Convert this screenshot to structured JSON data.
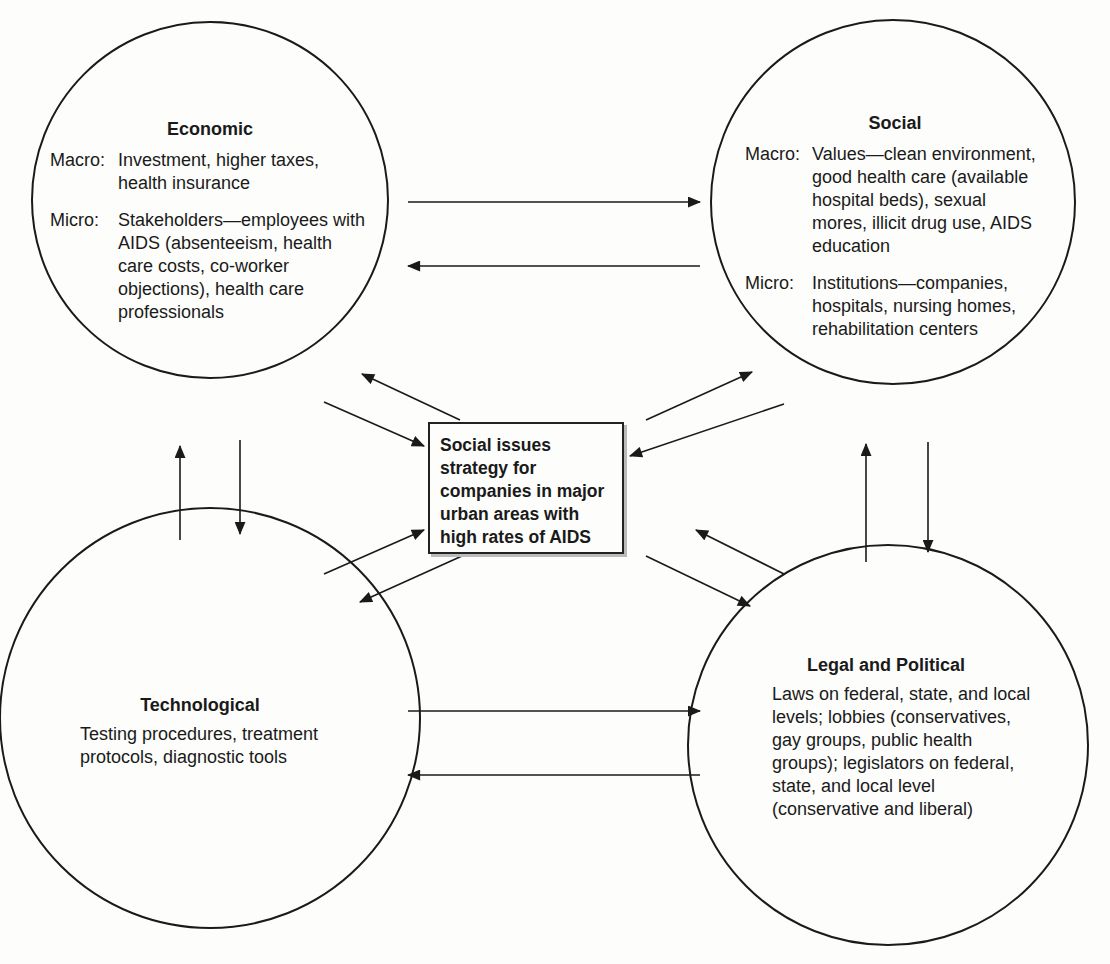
{
  "diagram": {
    "center": {
      "text": "Social issues strategy for companies in major urban areas with high rates of AIDS"
    },
    "nodes": {
      "economic": {
        "title": "Economic",
        "macro_label": "Macro:",
        "macro_text": "Investment, higher taxes, health insurance",
        "micro_label": "Micro:",
        "micro_text": "Stakeholders—employees with AIDS (absenteeism, health care costs, co-worker objections), health care professionals"
      },
      "social": {
        "title": "Social",
        "macro_label": "Macro:",
        "macro_text": "Values—clean environment, good health care (available hospital beds), sexual mores, illicit drug use, AIDS education",
        "micro_label": "Micro:",
        "micro_text": "Institutions—companies, hospitals, nursing homes, rehabilitation centers"
      },
      "technological": {
        "title": "Technological",
        "text": "Testing procedures, treatment protocols, diagnostic tools"
      },
      "legal_political": {
        "title": "Legal and Political",
        "text": "Laws on federal, state, and local levels; lobbies (conservatives, gay groups, public health groups); legislators on federal, state, and local level (conservative and liberal)"
      }
    },
    "connections": [
      {
        "from": "economic",
        "to": "social",
        "bidirectional": true
      },
      {
        "from": "technological",
        "to": "legal_political",
        "bidirectional": true
      },
      {
        "from": "economic",
        "to": "technological",
        "bidirectional": true
      },
      {
        "from": "social",
        "to": "legal_political",
        "bidirectional": true
      },
      {
        "from": "economic",
        "to": "center",
        "bidirectional": true
      },
      {
        "from": "social",
        "to": "center",
        "bidirectional": true
      },
      {
        "from": "technological",
        "to": "center",
        "bidirectional": true
      },
      {
        "from": "legal_political",
        "to": "center",
        "bidirectional": true
      }
    ]
  }
}
